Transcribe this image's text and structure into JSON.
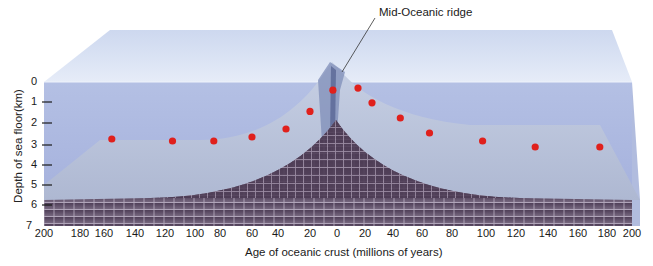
{
  "title": "Mid-Oceanic ridge",
  "callout_label": "Mid-Oceanic ridge",
  "y_axis": {
    "label": "Depth of sea floor(km)",
    "ticks": [
      "0",
      "1",
      "2",
      "3",
      "4",
      "5",
      "6",
      "7"
    ],
    "range": [
      0,
      7
    ]
  },
  "x_axis": {
    "label": "Age of oceanic crust (millions of years)",
    "ticks": [
      "200",
      "180",
      "160",
      "140",
      "120",
      "100",
      "80",
      "60",
      "40",
      "20",
      "0",
      "20",
      "40",
      "60",
      "80",
      "100",
      "120",
      "140",
      "160",
      "180",
      "200"
    ],
    "range_left": [
      200,
      0
    ],
    "range_right": [
      0,
      200
    ]
  },
  "colors": {
    "water_top": "#dfe7f6",
    "water_front": "#a9b6df",
    "sea_floor": "#b9c4dc",
    "crust": "#6b5a72",
    "crust_lines": "#c9bfcc",
    "sample_point": "#e0201c"
  },
  "chart_data": {
    "type": "scatter",
    "title": "",
    "xlabel": "Age of oceanic crust (millions of years)",
    "ylabel": "Depth of sea floor(km)",
    "ylim": [
      0,
      7
    ],
    "annotations": [
      "Mid-Oceanic ridge"
    ],
    "series": [
      {
        "name": "West of ridge",
        "points": [
          {
            "age": 155,
            "depth": 3.5
          },
          {
            "age": 115,
            "depth": 3.6
          },
          {
            "age": 85,
            "depth": 3.6
          },
          {
            "age": 60,
            "depth": 3.4
          },
          {
            "age": 35,
            "depth": 3.0
          },
          {
            "age": 20,
            "depth": 2.2
          },
          {
            "age": 3,
            "depth": 1.2
          }
        ]
      },
      {
        "name": "East of ridge",
        "points": [
          {
            "age": 15,
            "depth": 1.1
          },
          {
            "age": 25,
            "depth": 1.8
          },
          {
            "age": 45,
            "depth": 2.5
          },
          {
            "age": 65,
            "depth": 3.2
          },
          {
            "age": 98,
            "depth": 3.6
          },
          {
            "age": 132,
            "depth": 3.9
          },
          {
            "age": 175,
            "depth": 3.9
          }
        ]
      }
    ]
  }
}
